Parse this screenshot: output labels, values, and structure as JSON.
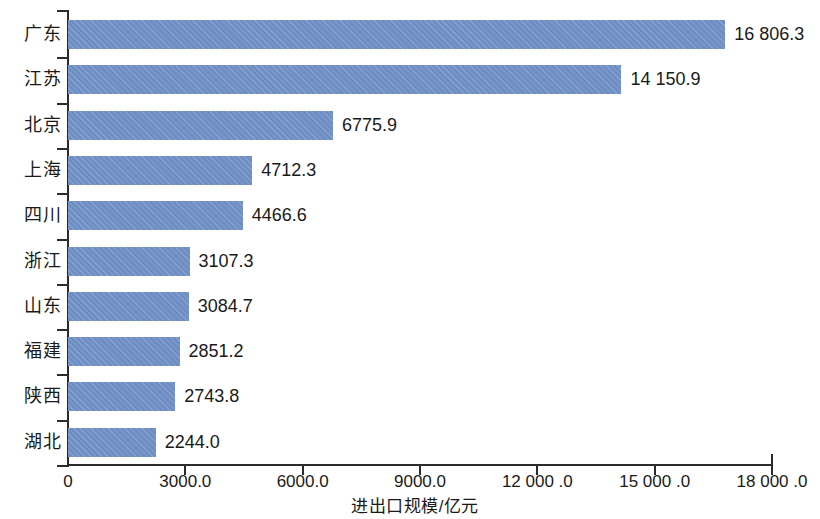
{
  "chart_data": {
    "type": "bar",
    "orientation": "horizontal",
    "title": "",
    "subtitle": "",
    "xlabel": "进出口规模/亿元",
    "ylabel": "",
    "categories": [
      "广东",
      "江苏",
      "北京",
      "上海",
      "四川",
      "浙江",
      "山东",
      "福建",
      "陕西",
      "湖北"
    ],
    "values": [
      16806.3,
      14150.9,
      6775.9,
      4712.3,
      4466.6,
      3107.3,
      3084.7,
      2851.2,
      2743.8,
      2244.0
    ],
    "value_labels": [
      "16 806.3",
      "14 150.9",
      "6775.9",
      "4712.3",
      "4466.6",
      "3107.3",
      "3084.7",
      "2851.2",
      "2743.8",
      "2244.0"
    ],
    "xlim": [
      0,
      18000
    ],
    "xticks": [
      0,
      3000,
      6000,
      9000,
      12000,
      15000,
      18000
    ],
    "xtick_labels": [
      "0",
      "3000.0",
      "6000.0",
      "9000.0",
      "12 000 .0",
      "15 000 .0",
      "18 000 .0"
    ],
    "grid": false,
    "legend": null,
    "bar_color": "#6f8fc4",
    "axis_color": "#2b2b2b",
    "background": "#ffffff"
  }
}
